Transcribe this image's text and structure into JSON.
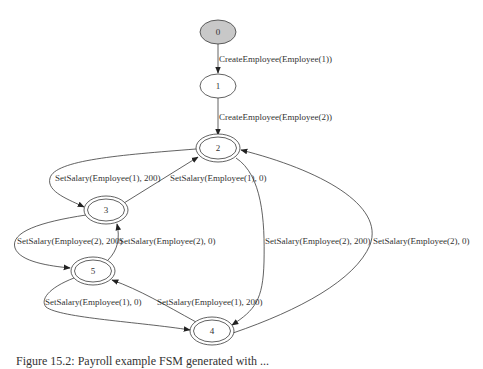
{
  "diagram": {
    "type": "finite-state-machine",
    "nodes": [
      {
        "id": "0",
        "label": "0",
        "style": "start",
        "fill": "#c8c8c8"
      },
      {
        "id": "1",
        "label": "1",
        "style": "single"
      },
      {
        "id": "2",
        "label": "2",
        "style": "double"
      },
      {
        "id": "3",
        "label": "3",
        "style": "double"
      },
      {
        "id": "4",
        "label": "4",
        "style": "double"
      },
      {
        "id": "5",
        "label": "5",
        "style": "double"
      }
    ],
    "edges": [
      {
        "from": "0",
        "to": "1",
        "label": "CreateEmployee(Employee(1))"
      },
      {
        "from": "1",
        "to": "2",
        "label": "CreateEmployee(Employee(2))"
      },
      {
        "from": "2",
        "to": "3",
        "label": "SetSalary(Employee(1), 200)"
      },
      {
        "from": "3",
        "to": "2",
        "label": "SetSalary(Employee(1), 0)"
      },
      {
        "from": "3",
        "to": "5",
        "label": "SetSalary(Employee(2), 200)"
      },
      {
        "from": "5",
        "to": "3",
        "label": "SetSalary(Employee(2), 0)"
      },
      {
        "from": "2",
        "to": "4",
        "label": "SetSalary(Employee(2), 200)"
      },
      {
        "from": "4",
        "to": "2",
        "label": "SetSalary(Employee(2), 0)"
      },
      {
        "from": "5",
        "to": "4",
        "label": "SetSalary(Employee(1), 0)"
      },
      {
        "from": "4",
        "to": "5",
        "label": "SetSalary(Employee(1), 200)"
      }
    ]
  },
  "caption": "Figure 15.2: Payroll example FSM generated with ..."
}
